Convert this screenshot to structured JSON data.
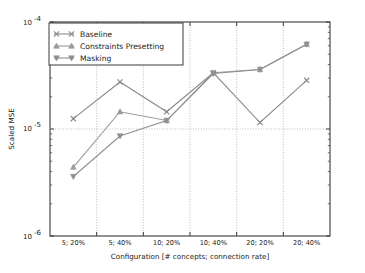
{
  "chart_data": {
    "type": "line",
    "title": "",
    "xlabel": "Configuration [# concepts; connection rate]",
    "ylabel": "Scaled MSE",
    "categories": [
      "5; 20%",
      "5; 40%",
      "10; 20%",
      "10; 40%",
      "20; 20%",
      "20; 40%"
    ],
    "yscale": "log",
    "ylim": [
      1e-06,
      0.0001
    ],
    "ytick_labels": [
      "10",
      "-6",
      "10",
      "-5",
      "10",
      "-4"
    ],
    "yticks": [
      1e-06,
      1e-05,
      0.0001
    ],
    "grid": "dotted",
    "legend_position": "upper left",
    "series": [
      {
        "name": "Baseline",
        "marker": "x-marker",
        "color": "#8a8a8a",
        "values": [
          1.25e-05,
          2.75e-05,
          1.45e-05,
          3.35e-05,
          1.15e-05,
          2.85e-05
        ]
      },
      {
        "name": "Constraints Presetting",
        "marker": "triangle-up-marker",
        "color": "#9a9a9a",
        "values": [
          4.4e-06,
          1.45e-05,
          1.2e-05,
          3.35e-05,
          3.6e-05,
          6.2e-05
        ]
      },
      {
        "name": "Masking",
        "marker": "triangle-down-marker",
        "color": "#8f8f8f",
        "values": [
          3.6e-06,
          8.6e-06,
          1.2e-05,
          3.3e-05,
          3.6e-05,
          6.2e-05
        ]
      }
    ]
  },
  "axes": {
    "y_exponent_top": "-4",
    "y_exponent_mid": "-5",
    "y_exponent_bottom": "-6",
    "y_mantissa": "10"
  },
  "legend": {
    "items": [
      {
        "label": "Baseline"
      },
      {
        "label": "Constraints Presetting"
      },
      {
        "label": "Masking"
      }
    ]
  },
  "colors": {
    "axis": "#3a3a3a",
    "grid": "#b0b0b0",
    "background": "#ffffff",
    "text": "#1a1a1a"
  }
}
